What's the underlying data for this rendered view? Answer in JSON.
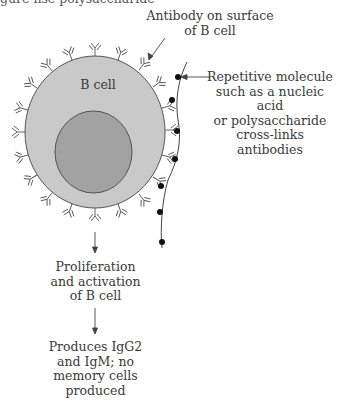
{
  "figure": {
    "top_cutoff_text": "gure                 nse           polysaccharide",
    "labels": {
      "antibody": "Antibody on surface\nof B cell",
      "b_cell": "B cell",
      "repetitive_molecule": "Repetitive molecule\nsuch as a nucleic acid\nor polysaccharide\ncross-links\nantibodies",
      "proliferation": "Proliferation\nand activation\nof B cell",
      "produces": "Produces IgG2\nand IgM; no\nmemory cells\nproduced"
    },
    "colors": {
      "cytoplasm": "#c9c9c9",
      "nucleus": "#a2a2a2",
      "outline": "#555555",
      "antigen_bead": "#111111"
    }
  }
}
